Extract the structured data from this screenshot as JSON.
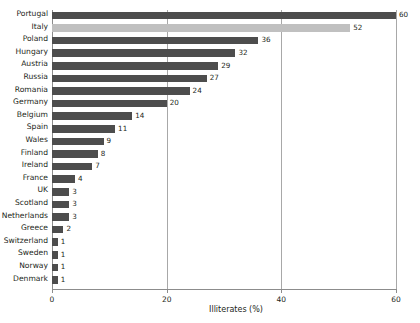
{
  "chart_data": {
    "type": "bar",
    "orientation": "horizontal",
    "title": "",
    "xlabel": "Illiterates (%)",
    "ylabel": "",
    "xlim": [
      0,
      60
    ],
    "xticks": [
      0,
      20,
      40,
      60
    ],
    "xtick_labels": [
      "0",
      "20",
      "40",
      "60"
    ],
    "grid": "vertical",
    "legend": "none",
    "categories": [
      "Portugal",
      "Italy",
      "Poland",
      "Hungary",
      "Austria",
      "Russia",
      "Romania",
      "Germany",
      "Belgium",
      "Spain",
      "Wales",
      "Finland",
      "Ireland",
      "France",
      "UK",
      "Scotland",
      "Netherlands",
      "Greece",
      "Switzerland",
      "Sweden",
      "Norway",
      "Denmark"
    ],
    "values": [
      60,
      52,
      36,
      32,
      29,
      27,
      24,
      20,
      14,
      11,
      9,
      8,
      7,
      4,
      3,
      3,
      3,
      2,
      1,
      1,
      1,
      1
    ],
    "value_labels": [
      "60",
      "52",
      "36",
      "32",
      "29",
      "27",
      "24",
      "20",
      "14",
      "11",
      "9",
      "8",
      "7",
      "4",
      "3",
      "3",
      "3",
      "2",
      "1",
      "1",
      "1",
      "1"
    ],
    "highlighted_category": "Italy",
    "colors": {
      "bar": "#4d4d4d",
      "bar_highlight": "#c0c0c0",
      "gridline": "#a8a8a8",
      "axis": "#8c8c8c",
      "text": "#231f20",
      "background": "#ffffff"
    }
  }
}
